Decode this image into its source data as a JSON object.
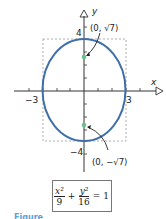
{
  "diagram": {
    "axes": {
      "x_label": "x",
      "y_label": "y"
    },
    "tick_labels": {
      "x_neg": "−3",
      "x_pos": "3",
      "y_pos": "4",
      "y_neg": "−4"
    },
    "foci": [
      {
        "label": "(0, √7)",
        "x": 0,
        "y": 2.6458
      },
      {
        "label": "(0, −√7)",
        "x": 0,
        "y": -2.6458
      }
    ],
    "ellipse": {
      "a": 3,
      "b": 4,
      "color": "#3f6fa8"
    },
    "focus_color": "#6cbf8a",
    "equation": {
      "term1_num": "x²",
      "term1_den": "9",
      "plus": "+",
      "term2_num": "y²",
      "term2_den": "16",
      "equals": "= 1"
    },
    "caption": "Figure"
  }
}
